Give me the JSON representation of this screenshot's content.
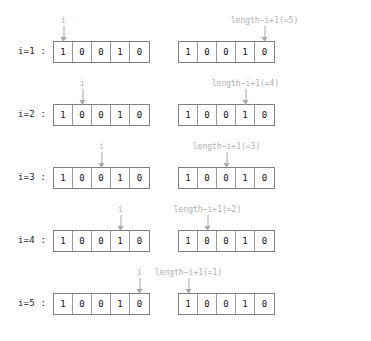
{
  "diagram": {
    "title": "",
    "array_values": [
      "1",
      "0",
      "0",
      "1",
      "0"
    ],
    "array_length": 5,
    "colors": {
      "box_border": "#808080",
      "cell_divider": "#9a9a9a",
      "digit": "#111111",
      "annotation": "#b0b0b0",
      "arrow": "#a8a8a8",
      "row_label": "#1a1a1a",
      "background": "#ffffff"
    },
    "rows": [
      {
        "label": "i=1 :",
        "left": {
          "cells": [
            "1",
            "0",
            "0",
            "1",
            "0"
          ],
          "arrow_label": "i",
          "arrow_index": 1
        },
        "right": {
          "cells": [
            "1",
            "0",
            "0",
            "1",
            "0"
          ],
          "arrow_label": "length−i+1(=5)",
          "arrow_index": 5
        }
      },
      {
        "label": "i=2 :",
        "left": {
          "cells": [
            "1",
            "0",
            "0",
            "1",
            "0"
          ],
          "arrow_label": "i",
          "arrow_index": 2
        },
        "right": {
          "cells": [
            "1",
            "0",
            "0",
            "1",
            "0"
          ],
          "arrow_label": "length−i+1(=4)",
          "arrow_index": 4
        }
      },
      {
        "label": "i=3 :",
        "left": {
          "cells": [
            "1",
            "0",
            "0",
            "1",
            "0"
          ],
          "arrow_label": "i",
          "arrow_index": 3
        },
        "right": {
          "cells": [
            "1",
            "0",
            "0",
            "1",
            "0"
          ],
          "arrow_label": "length−i+1(=3)",
          "arrow_index": 3
        }
      },
      {
        "label": "i=4 :",
        "left": {
          "cells": [
            "1",
            "0",
            "0",
            "1",
            "0"
          ],
          "arrow_label": "i",
          "arrow_index": 4
        },
        "right": {
          "cells": [
            "1",
            "0",
            "0",
            "1",
            "0"
          ],
          "arrow_label": "length−i+1(=2)",
          "arrow_index": 2
        }
      },
      {
        "label": "i=5 :",
        "left": {
          "cells": [
            "1",
            "0",
            "0",
            "1",
            "0"
          ],
          "arrow_label": "i",
          "arrow_index": 5
        },
        "right": {
          "cells": [
            "1",
            "0",
            "0",
            "1",
            "0"
          ],
          "arrow_label": "length−i+1(=1)",
          "arrow_index": 1
        }
      }
    ]
  }
}
